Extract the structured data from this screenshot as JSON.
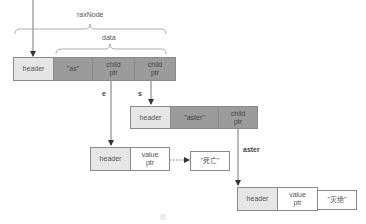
{
  "diagram": {
    "labels": {
      "raxnode": "raxNode",
      "data": "data"
    },
    "root_node": {
      "header": "header",
      "key": "\"as\"",
      "child_ptr_1": "child\nptr",
      "child_ptr_2": "child\nptr"
    },
    "edges": {
      "e": "e",
      "s": "s",
      "aster": "aster"
    },
    "aster_node": {
      "header": "header",
      "key": "\"aster\"",
      "child_ptr": "child\nptr"
    },
    "leaf_e": {
      "header": "header",
      "value_ptr": "value\nptr",
      "value": "\"死亡\""
    },
    "leaf_aster": {
      "header": "header",
      "value_ptr": "value\nptr",
      "value": "\"灭绝\""
    },
    "caption": "图"
  },
  "colors": {
    "header_fill": "#e6e6e6",
    "data_fill": "#9b9b9b",
    "border": "#8a8a8a",
    "line": "#777777"
  }
}
